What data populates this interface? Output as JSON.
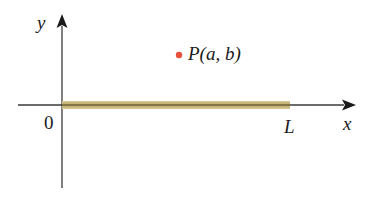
{
  "diagram": {
    "type": "coordinate-plane",
    "axes": {
      "x_label": "x",
      "y_label": "y",
      "origin_label": "0"
    },
    "rod": {
      "from": 0,
      "to_label": "L",
      "color": "#c8b878",
      "core_color": "#5a4a2a"
    },
    "point": {
      "label": "P(a, b)",
      "color": "#e8503a"
    },
    "colors": {
      "axis": "#3a3a3a",
      "text": "#1a1a1a"
    }
  }
}
